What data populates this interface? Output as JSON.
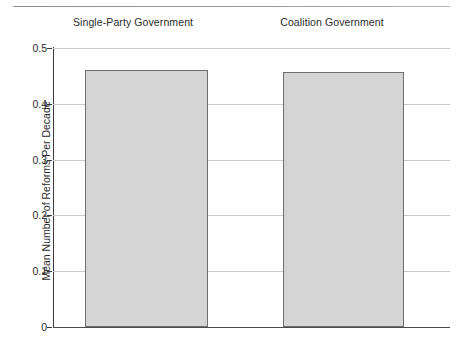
{
  "chart_data": {
    "type": "bar",
    "title": "",
    "subtitle": "",
    "categories": [
      "Single-Party Government",
      "Coalition Government"
    ],
    "values": [
      0.461,
      0.457
    ],
    "xlabel": "",
    "ylabel": "Mean Number of Reforms Per Decade",
    "ylim": [
      0,
      0.5
    ],
    "yticks": [
      "0",
      "0.1",
      "0.2",
      "0.3",
      "0.4",
      "0.5"
    ],
    "ytick_values": [
      0,
      0.1,
      0.2,
      0.3,
      0.4,
      0.5
    ],
    "grid": "horizontal",
    "legend": "none",
    "bar_fill_color": "#d5d5d5",
    "bar_border_color": "#6f6f6f",
    "gridline_color": "#c9c9c9",
    "axis_color": "#3a3a3a",
    "text_color": "#2b2b2b",
    "panels": [
      {
        "label": "Single-Party Government",
        "value": 0.461
      },
      {
        "label": "Coalition Government",
        "value": 0.457
      }
    ]
  }
}
